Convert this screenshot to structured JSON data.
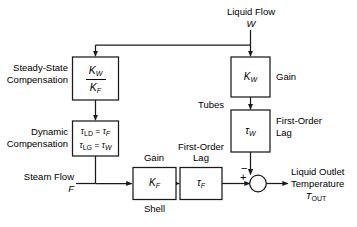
{
  "diagram": {
    "stroke_color": "#1a1a1a",
    "background_color": "#ffffff",
    "blocks": [
      {
        "id": "steady-state-gain",
        "label_numerator": "K",
        "label_numerator_sub": "W",
        "label_denominator": "K",
        "label_denominator_sub": "F",
        "side_label": "Steady-State\nCompensation"
      },
      {
        "id": "dynamic-compensation",
        "line1": "τLD = τF",
        "line2": "τLG = τW",
        "side_label": "Dynamic\nCompensation"
      },
      {
        "id": "shell-gain",
        "label": "K",
        "label_sub": "F",
        "top_label": "Gain",
        "bottom_label": "Shell"
      },
      {
        "id": "shell-lag",
        "label": "τ",
        "label_sub": "F",
        "top_label": "First-Order\nLag"
      },
      {
        "id": "tubes-gain",
        "label": "K",
        "label_sub": "W",
        "side_label": "Gain"
      },
      {
        "id": "tubes-lag",
        "label": "τ",
        "label_sub": "W",
        "side_label": "First-Order\nLag",
        "group_label": "Tubes"
      }
    ],
    "inputs": [
      {
        "id": "liquid-flow",
        "line1": "Liquid Flow",
        "line2": "W"
      },
      {
        "id": "steam-flow",
        "line1": "Steam Flow",
        "line2": "F"
      }
    ],
    "outputs": [
      {
        "id": "liquid-outlet-temperature",
        "line1": "Liquid Outlet",
        "line2": "Temperature",
        "line3": "T",
        "line3_sub": "OUT"
      }
    ],
    "summing_junction": {
      "id": "summing-junction",
      "plus_sign": "+",
      "minus_sign": "−"
    },
    "labels": {
      "steady_state_line1": "Steady-State",
      "steady_state_line2": "Compensation",
      "dynamic_line1": "Dynamic",
      "dynamic_line2": "Compensation",
      "gain_shell": "Gain",
      "gain_tubes": "Gain",
      "first_order_lag_shell_line1": "First-Order",
      "first_order_lag_shell_line2": "Lag",
      "first_order_lag_tubes_line1": "First-Order",
      "first_order_lag_tubes_line2": "Lag",
      "tubes": "Tubes",
      "shell": "Shell",
      "liquid_flow": "Liquid Flow",
      "liquid_flow_var": "W",
      "steam_flow": "Steam Flow",
      "steam_flow_var": "F",
      "liquid_outlet_line1": "Liquid Outlet",
      "liquid_outlet_line2": "Temperature",
      "t_out_base": "T",
      "t_out_sub": "OUT",
      "kw_num": "K",
      "kw_num_sub": "W",
      "kf_den": "K",
      "kf_den_sub": "F",
      "tau_ld": "τ",
      "tau_ld_sub": "LD",
      "eq": " = ",
      "tau_f": "τ",
      "tau_f_sub": "F",
      "tau_lg": "τ",
      "tau_lg_sub": "LG",
      "tau_w": "τ",
      "tau_w_sub": "W",
      "k_f": "K",
      "k_f_sub": "F",
      "k_w": "K",
      "k_w_sub": "W",
      "plus": "+",
      "minus": "−"
    }
  }
}
